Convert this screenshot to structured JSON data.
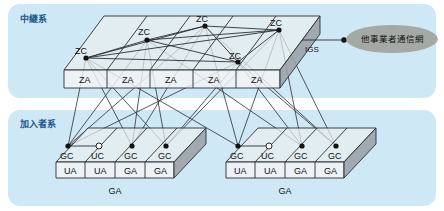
{
  "figure": {
    "background_color": "#ffffff",
    "panel_color": "#cfe8f5",
    "slab_top_color": "#e9eef1",
    "slab_face_color": "#f2f4f6",
    "slab_end_color": "#9aa3a8",
    "line_color": "#2b2f33",
    "label_color": "#1a5a8a"
  },
  "panels": [
    {
      "id": "trunk",
      "label": "中継系"
    },
    {
      "id": "subscriber",
      "label": "加入者系"
    }
  ],
  "trunk_layer": {
    "node_label": "ZC",
    "nodes": [
      {
        "label": "ZC",
        "x": 86,
        "y": 58
      },
      {
        "label": "ZC",
        "x": 147,
        "y": 40
      },
      {
        "label": "ZC",
        "x": 205,
        "y": 26
      },
      {
        "label": "ZC",
        "x": 238,
        "y": 62
      },
      {
        "label": "ZC",
        "x": 279,
        "y": 30
      }
    ],
    "cells": [
      {
        "label": "ZA"
      },
      {
        "label": "ZA"
      },
      {
        "label": "ZA"
      },
      {
        "label": "ZA"
      },
      {
        "label": "ZA"
      }
    ]
  },
  "external": {
    "gateway_label": "IGS",
    "network_label": "他事業者通信網",
    "gateway_point": {
      "x": 344,
      "y": 40
    }
  },
  "subscriber_layer": {
    "groups": [
      {
        "id": "left",
        "ga_label": "GA",
        "nodes": [
          {
            "label": "GC",
            "type": "filled",
            "x": 68,
            "y": 146
          },
          {
            "label": "UC",
            "type": "hollow",
            "x": 99,
            "y": 146
          },
          {
            "label": "GC",
            "type": "filled",
            "x": 132,
            "y": 146
          },
          {
            "label": "GC",
            "type": "filled",
            "x": 166,
            "y": 146
          }
        ],
        "cells": [
          {
            "label": "UA"
          },
          {
            "label": "UA"
          },
          {
            "label": "GA"
          },
          {
            "label": "GA"
          }
        ]
      },
      {
        "id": "right",
        "ga_label": "GA",
        "nodes": [
          {
            "label": "GC",
            "type": "filled",
            "x": 238,
            "y": 146
          },
          {
            "label": "UC",
            "type": "hollow",
            "x": 269,
            "y": 146
          },
          {
            "label": "GC",
            "type": "filled",
            "x": 302,
            "y": 146
          },
          {
            "label": "GC",
            "type": "filled",
            "x": 336,
            "y": 146
          }
        ],
        "cells": [
          {
            "label": "UA"
          },
          {
            "label": "UA"
          },
          {
            "label": "GA"
          },
          {
            "label": "GA"
          }
        ]
      }
    ]
  }
}
